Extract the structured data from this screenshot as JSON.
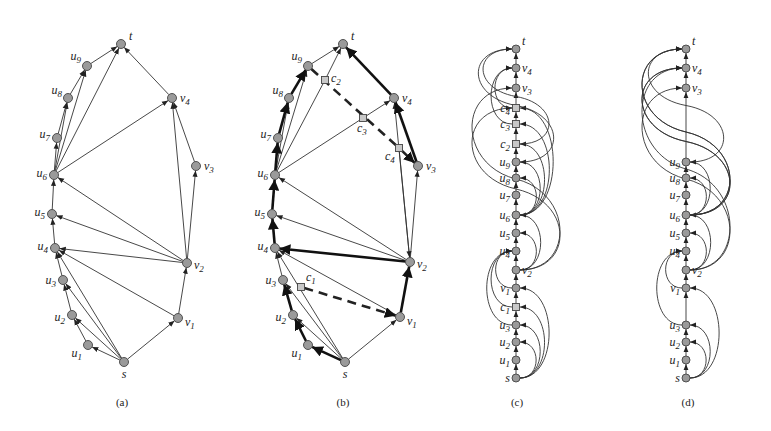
{
  "figure": {
    "panels": [
      {
        "id": "a",
        "caption": "(a)",
        "kind": "planar",
        "nodes": [
          {
            "id": "t",
            "label": "t",
            "type": "vertex"
          },
          {
            "id": "u9",
            "label": "u9",
            "type": "vertex"
          },
          {
            "id": "u8",
            "label": "u8",
            "type": "vertex"
          },
          {
            "id": "u7",
            "label": "u7",
            "type": "vertex"
          },
          {
            "id": "u6",
            "label": "u6",
            "type": "vertex"
          },
          {
            "id": "u5",
            "label": "u5",
            "type": "vertex"
          },
          {
            "id": "u4",
            "label": "u4",
            "type": "vertex"
          },
          {
            "id": "u3",
            "label": "u3",
            "type": "vertex"
          },
          {
            "id": "u2",
            "label": "u2",
            "type": "vertex"
          },
          {
            "id": "u1",
            "label": "u1",
            "type": "vertex"
          },
          {
            "id": "s",
            "label": "s",
            "type": "vertex"
          },
          {
            "id": "v1",
            "label": "v1",
            "type": "vertex"
          },
          {
            "id": "v2",
            "label": "v2",
            "type": "vertex"
          },
          {
            "id": "v3",
            "label": "v3",
            "type": "vertex"
          },
          {
            "id": "v4",
            "label": "v4",
            "type": "vertex"
          }
        ],
        "edges": [
          [
            "s",
            "u1"
          ],
          [
            "s",
            "u2"
          ],
          [
            "s",
            "u3"
          ],
          [
            "s",
            "u4"
          ],
          [
            "s",
            "v1"
          ],
          [
            "u1",
            "u2"
          ],
          [
            "u2",
            "u3"
          ],
          [
            "u3",
            "u4"
          ],
          [
            "u4",
            "u5"
          ],
          [
            "u5",
            "u6"
          ],
          [
            "u6",
            "u7"
          ],
          [
            "u7",
            "u8"
          ],
          [
            "u6",
            "u8"
          ],
          [
            "u8",
            "u9"
          ],
          [
            "u6",
            "u9"
          ],
          [
            "u9",
            "t"
          ],
          [
            "u6",
            "t"
          ],
          [
            "u6",
            "v4"
          ],
          [
            "v4",
            "t"
          ],
          [
            "v1",
            "v2"
          ],
          [
            "v1",
            "u4"
          ],
          [
            "v2",
            "u4"
          ],
          [
            "v2",
            "u5"
          ],
          [
            "v2",
            "u6"
          ],
          [
            "v2",
            "v3"
          ],
          [
            "v2",
            "v4"
          ],
          [
            "v3",
            "v4"
          ]
        ]
      },
      {
        "id": "b",
        "caption": "(b)",
        "kind": "planar",
        "nodes": [
          {
            "id": "t",
            "label": "t",
            "type": "vertex"
          },
          {
            "id": "u9",
            "label": "u9",
            "type": "vertex"
          },
          {
            "id": "u8",
            "label": "u8",
            "type": "vertex"
          },
          {
            "id": "u7",
            "label": "u7",
            "type": "vertex"
          },
          {
            "id": "u6",
            "label": "u6",
            "type": "vertex"
          },
          {
            "id": "u5",
            "label": "u5",
            "type": "vertex"
          },
          {
            "id": "u4",
            "label": "u4",
            "type": "vertex"
          },
          {
            "id": "u3",
            "label": "u3",
            "type": "vertex"
          },
          {
            "id": "u2",
            "label": "u2",
            "type": "vertex"
          },
          {
            "id": "u1",
            "label": "u1",
            "type": "vertex"
          },
          {
            "id": "s",
            "label": "s",
            "type": "vertex"
          },
          {
            "id": "v1",
            "label": "v1",
            "type": "vertex"
          },
          {
            "id": "v2",
            "label": "v2",
            "type": "vertex"
          },
          {
            "id": "v3",
            "label": "v3",
            "type": "vertex"
          },
          {
            "id": "v4",
            "label": "v4",
            "type": "vertex"
          },
          {
            "id": "c1",
            "label": "c1",
            "type": "crossing"
          },
          {
            "id": "c2",
            "label": "c2",
            "type": "crossing"
          },
          {
            "id": "c3",
            "label": "c3",
            "type": "crossing"
          },
          {
            "id": "c4",
            "label": "c4",
            "type": "crossing"
          }
        ],
        "edges_thin": [
          [
            "s",
            "u2"
          ],
          [
            "s",
            "u3"
          ],
          [
            "s",
            "u4"
          ],
          [
            "s",
            "v1"
          ],
          [
            "u3",
            "u4"
          ],
          [
            "v1",
            "u4"
          ],
          [
            "v2",
            "u5"
          ],
          [
            "v2",
            "u6"
          ],
          [
            "v2",
            "v4"
          ],
          [
            "v2",
            "v3"
          ],
          [
            "u6",
            "u8"
          ],
          [
            "u6",
            "u9"
          ],
          [
            "u9",
            "t"
          ],
          [
            "u6",
            "c3"
          ],
          [
            "c3",
            "v4"
          ],
          [
            "c2",
            "t"
          ],
          [
            "u6",
            "c2"
          ],
          [
            "c4",
            "v2"
          ]
        ],
        "edges_bold": [
          [
            "s",
            "u1"
          ],
          [
            "u1",
            "u2"
          ],
          [
            "u2",
            "u3"
          ],
          [
            "u4",
            "u5"
          ],
          [
            "u5",
            "u6"
          ],
          [
            "u6",
            "u7"
          ],
          [
            "u7",
            "u8"
          ],
          [
            "u8",
            "u9"
          ],
          [
            "v1",
            "v2"
          ],
          [
            "v2",
            "u4"
          ],
          [
            "v3",
            "v4"
          ],
          [
            "v4",
            "t"
          ]
        ],
        "edges_dashed": [
          [
            "c1",
            "v1"
          ],
          [
            "u9",
            "c4"
          ],
          [
            "c4",
            "v3"
          ]
        ]
      },
      {
        "id": "c",
        "caption": "(c)",
        "kind": "linear",
        "order": [
          "s",
          "u1",
          "u2",
          "u3",
          "c1",
          "v1",
          "v2",
          "u4",
          "u5",
          "u6",
          "u7",
          "u8",
          "u9",
          "c2",
          "c3",
          "c4",
          "v3",
          "v4",
          "t"
        ],
        "labels": {
          "s": "s",
          "u1": "u1",
          "u2": "u2",
          "u3": "u3",
          "c1": "c1",
          "v1": "v1",
          "v2": "v2",
          "u4": "u4",
          "u5": "u5",
          "u6": "u6",
          "u7": "u7",
          "u8": "u8",
          "u9": "u9",
          "c2": "c2",
          "c3": "c3",
          "c4": "c4",
          "v3": "v3",
          "v4": "v4",
          "t": "t"
        },
        "crossings": [
          "c1",
          "c2",
          "c3",
          "c4"
        ],
        "arcs_right": [
          [
            "s",
            "u2"
          ],
          [
            "s",
            "u3"
          ],
          [
            "s",
            "c1"
          ],
          [
            "s",
            "v1"
          ],
          [
            "v2",
            "u5"
          ],
          [
            "v2",
            "u6"
          ],
          [
            "u6",
            "u8"
          ],
          [
            "u6",
            "u9"
          ],
          [
            "u6",
            "c2"
          ],
          [
            "u6",
            "c3"
          ],
          [
            "u6",
            "c4"
          ],
          [
            "v2",
            "v3"
          ],
          [
            "v2",
            "c4"
          ]
        ],
        "arcs_left": [
          [
            "v1",
            "u4"
          ],
          [
            "c1",
            "u4"
          ],
          [
            "u3",
            "u4"
          ],
          [
            "c2",
            "t"
          ],
          [
            "u9",
            "t"
          ],
          [
            "c3",
            "v4"
          ],
          [
            "c4",
            "v4"
          ]
        ]
      },
      {
        "id": "d",
        "caption": "(d)",
        "kind": "linear",
        "order": [
          "s",
          "u1",
          "u2",
          "u3",
          "v1",
          "v2",
          "u4",
          "u5",
          "u6",
          "u7",
          "u8",
          "u9",
          "v3",
          "v4",
          "t"
        ],
        "labels": {
          "s": "s",
          "u1": "u1",
          "u2": "u2",
          "u3": "u3",
          "v1": "v1",
          "v2": "v2",
          "u4": "u4",
          "u5": "u5",
          "u6": "u6",
          "u7": "u7",
          "u8": "u8",
          "u9": "u9",
          "v3": "v3",
          "v4": "v4",
          "t": "t"
        },
        "crossings": [],
        "arcs_right": [
          [
            "s",
            "u2"
          ],
          [
            "s",
            "u3"
          ],
          [
            "s",
            "v1"
          ],
          [
            "v2",
            "u5"
          ],
          [
            "v2",
            "u6"
          ],
          [
            "u6",
            "u8"
          ],
          [
            "u6",
            "u9"
          ],
          [
            "u6",
            "t"
          ],
          [
            "u6",
            "v4"
          ],
          [
            "v2",
            "v3"
          ],
          [
            "v2",
            "v4"
          ]
        ],
        "arcs_left": [
          [
            "v1",
            "u4"
          ],
          [
            "u3",
            "u4"
          ],
          [
            "u9",
            "t"
          ],
          [
            "u6",
            "t"
          ],
          [
            "u6",
            "v4"
          ]
        ]
      }
    ]
  }
}
